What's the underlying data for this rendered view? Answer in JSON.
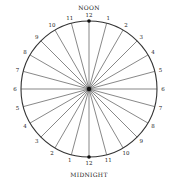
{
  "diagram": {
    "title_top": "NOON",
    "title_bottom": "MIDNIGHT",
    "center": [
      89,
      89
    ],
    "radius": 68,
    "spoke_count": 24,
    "colors": {
      "stroke": "#333333",
      "spoke": "#555555",
      "text": "#222222",
      "background": "#ffffff"
    },
    "hour_labels": [
      "12",
      "1",
      "2",
      "3",
      "4",
      "5",
      "6",
      "7",
      "8",
      "9",
      "10",
      "11",
      "12",
      "1",
      "2",
      "3",
      "4",
      "5",
      "6",
      "7",
      "8",
      "9",
      "10",
      "11"
    ]
  }
}
